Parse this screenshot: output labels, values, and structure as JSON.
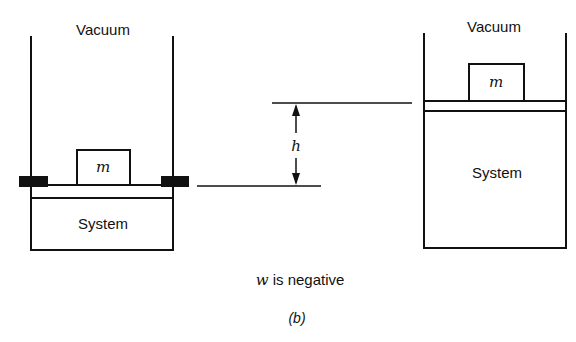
{
  "diagram": {
    "left_panel": {
      "vacuum_label": "Vacuum",
      "mass_label": "m",
      "system_label": "System",
      "state": "initial, piston held by stops"
    },
    "right_panel": {
      "vacuum_label": "Vacuum",
      "mass_label": "m",
      "system_label": "System",
      "state": "expanded, piston raised by h"
    },
    "displacement": {
      "label": "h"
    },
    "caption": {
      "w_symbol": "w",
      "text": " is negative",
      "figure_label": "(b)"
    },
    "colors": {
      "line": "#111111",
      "stop": "#111111",
      "background": "#ffffff"
    }
  }
}
